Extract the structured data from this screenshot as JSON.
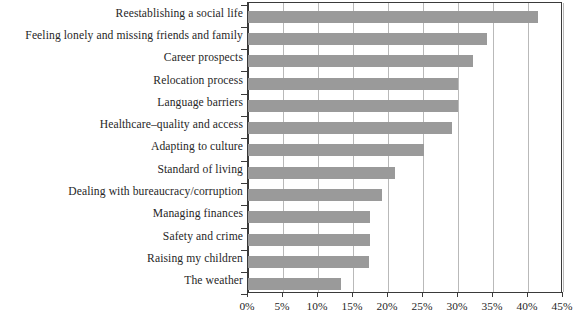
{
  "chart_data": {
    "type": "bar",
    "orientation": "horizontal",
    "title": "",
    "subtitle": "",
    "xlabel": "",
    "ylabel": "",
    "xlim": [
      0,
      45
    ],
    "xtick_labels": [
      "0%",
      "5%",
      "10%",
      "15%",
      "20%",
      "25%",
      "30%",
      "35%",
      "40%",
      "45%"
    ],
    "xticks": [
      0,
      5,
      10,
      15,
      20,
      25,
      30,
      35,
      40,
      45
    ],
    "grid": "vertical",
    "legend": "none",
    "bar_color": "#9a9a9a",
    "axis_color": "#3a3a3a",
    "gridline_color": "#b9b9b9",
    "categories": [
      "Reestablishing a social life",
      "Feeling lonely and missing friends and family",
      "Career prospects",
      "Relocation process",
      "Language barriers",
      "Healthcare–quality and access",
      "Adapting to culture",
      "Standard of living",
      "Dealing with bureaucracy/corruption",
      "Managing finances",
      "Safety and crime",
      "Raising my children",
      "The weather"
    ],
    "values": [
      41.4,
      34.1,
      32.2,
      30.0,
      30.0,
      29.2,
      25.2,
      21.0,
      19.2,
      17.4,
      17.4,
      17.3,
      13.3
    ],
    "unit": "%"
  }
}
